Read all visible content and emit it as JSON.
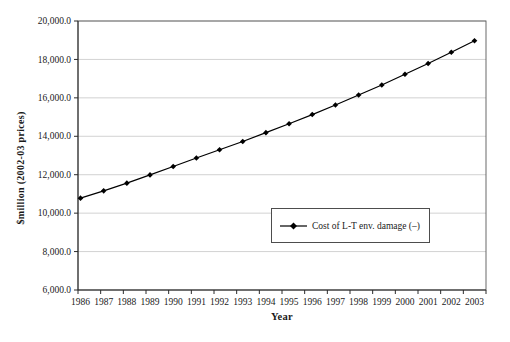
{
  "chart_data": {
    "type": "line",
    "title": "",
    "xlabel": "Year",
    "ylabel": "$million (2002-03 prices)",
    "x": [
      "1986",
      "1987",
      "1988",
      "1989",
      "1990",
      "1991",
      "1992",
      "1993",
      "1994",
      "1995",
      "1996",
      "1997",
      "1998",
      "1999",
      "2000",
      "2001",
      "2002",
      "2003"
    ],
    "series": [
      {
        "name": "Cost of L-T env. damage (–)",
        "marker": "diamond",
        "color": "#000000",
        "values": [
          10780,
          11160,
          11560,
          11990,
          12430,
          12870,
          13300,
          13730,
          14190,
          14650,
          15130,
          15630,
          16150,
          16670,
          17230,
          17790,
          18370,
          18970
        ]
      }
    ],
    "ylim": [
      6000,
      20000
    ],
    "yticks": [
      6000,
      8000,
      10000,
      12000,
      14000,
      16000,
      18000,
      20000
    ],
    "ytick_labels": [
      "6,000.0",
      "8,000.0",
      "10,000.0",
      "12,000.0",
      "14,000.0",
      "16,000.0",
      "18,000.0",
      "20,000.0"
    ],
    "grid": "horizontal",
    "legend_position": "inside-center-right",
    "colors": {
      "line": "#000000",
      "gridline": "#c6c6c6",
      "plot_border": "#595959",
      "axis": "#2b2b2b",
      "text": "#1a1a1a",
      "background": "#ffffff"
    }
  }
}
